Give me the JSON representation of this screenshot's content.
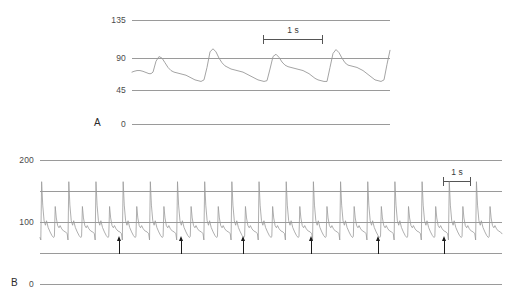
{
  "figure": {
    "panels": [
      {
        "letter": "A",
        "letter_x": 94,
        "letter_y": 117,
        "yticks": [
          {
            "label": "135",
            "y": 20
          },
          {
            "label": "90",
            "y": 58
          },
          {
            "label": "45",
            "y": 90
          },
          {
            "label": "0",
            "y": 124
          }
        ],
        "grid_x_start": 132,
        "grid_x_end": 390,
        "label_right_x": 126,
        "scalebar": {
          "label": "1 s",
          "x": 263,
          "y": 33,
          "width": 60
        },
        "trace_color": "#9a9a9a"
      },
      {
        "letter": "B",
        "letter_x": 11,
        "letter_y": 277,
        "yticks": [
          {
            "label": "200",
            "y": 160
          },
          {
            "label": "100",
            "y": 222
          },
          {
            "label": "0",
            "y": 284
          }
        ],
        "grid_x_start": 40,
        "grid_x_end": 502,
        "label_right_x": 34,
        "scalebar": {
          "label": "1 s",
          "x": 443,
          "y": 175,
          "width": 28
        },
        "trace_color": "#9a9a9a",
        "boundaries": {
          "top_y": 191,
          "bottom_y": 253
        },
        "arrows": [
          {
            "x": 119
          },
          {
            "x": 181
          },
          {
            "x": 243
          },
          {
            "x": 311
          },
          {
            "x": 378
          },
          {
            "x": 444
          }
        ]
      }
    ],
    "colors": {
      "grid": "#9a9a9a",
      "trace": "#9a9a9a",
      "arrow": "#1a1a1a",
      "text": "#3a3a3a",
      "background": "#ffffff"
    }
  },
  "chart_data": {
    "type": "line",
    "title": "",
    "xlabel": "",
    "ylabel": "Pressure (mmHg)",
    "panels": [
      {
        "name": "A",
        "ylim": [
          0,
          150
        ],
        "ytick_values": [
          0,
          45,
          90,
          135
        ],
        "grid": true,
        "scale_bar_seconds": 1,
        "description": "Arterial pressure waveform with alternating beat amplitude (pulsus alternans)",
        "systolic_peaks": [
          88,
          98,
          91,
          97,
          90,
          100,
          91
        ],
        "diastolic_troughs": [
          60,
          54,
          57,
          55,
          58,
          56,
          62
        ],
        "series": [
          {
            "name": "pressure-A",
            "x": [
              0,
              2,
              5,
              8,
              11,
              13,
              15,
              17,
              19,
              21,
              24,
              27,
              30,
              33,
              36,
              39,
              42,
              45,
              48,
              51,
              54,
              57,
              60,
              63,
              66,
              69,
              72,
              75,
              78,
              81,
              84,
              87,
              90,
              93,
              96,
              99,
              102,
              105,
              108,
              111,
              114,
              117,
              120,
              123,
              126,
              129,
              132,
              135,
              138,
              141,
              144,
              147,
              150,
              153,
              156,
              159,
              162,
              165,
              168,
              171,
              174,
              177,
              180,
              183,
              186,
              189,
              192,
              195,
              198,
              201,
              204,
              207,
              210,
              213,
              216,
              219,
              222,
              225,
              228,
              231,
              234,
              237,
              240,
              243,
              246,
              249,
              252,
              255,
              258
            ],
            "values": [
              68,
              69,
              70,
              70,
              69,
              68,
              67,
              66,
              66,
              68,
              82,
              88,
              86,
              80,
              74,
              70,
              68,
              67,
              66,
              65,
              64,
              62,
              60,
              58,
              57,
              56,
              58,
              74,
              94,
              98,
              94,
              86,
              80,
              76,
              74,
              72,
              71,
              70,
              69,
              68,
              66,
              64,
              62,
              60,
              58,
              57,
              56,
              57,
              72,
              88,
              91,
              87,
              81,
              77,
              75,
              74,
              73,
              72,
              71,
              70,
              68,
              66,
              63,
              60,
              58,
              57,
              56,
              56,
              74,
              92,
              97,
              93,
              86,
              80,
              77,
              76,
              75,
              74,
              72,
              70,
              67,
              64,
              61,
              58,
              57,
              56,
              58,
              78,
              96
            ]
          }
        ]
      },
      {
        "name": "B",
        "ylim": [
          0,
          200
        ],
        "ytick_values": [
          0,
          100,
          200
        ],
        "grid": true,
        "scale_bar_seconds": 1,
        "description": "Compressed arterial pressure recording showing pulsus alternans; arrows mark periodic events",
        "arrow_count": 6,
        "beat_count": 34,
        "alternating_peak_high": 165,
        "alternating_peak_low": 125,
        "trough_value": 75
      }
    ]
  }
}
